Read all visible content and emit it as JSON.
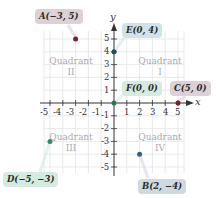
{
  "diagram": {
    "axes": {
      "x_label": "x",
      "y_label": "y",
      "x_range": [
        -5,
        5
      ],
      "y_range": [
        -5,
        5
      ]
    },
    "x_ticks": [
      "-5",
      "-4",
      "-3",
      "-2",
      "-1",
      "1",
      "2",
      "3",
      "4",
      "5"
    ],
    "y_ticks": [
      "5",
      "4",
      "3",
      "2",
      "1",
      "-1",
      "-2",
      "-3",
      "-4",
      "-5"
    ],
    "quadrants": [
      {
        "name": "Quadrant",
        "numeral": "I"
      },
      {
        "name": "Quadrant",
        "numeral": "II"
      },
      {
        "name": "Quadrant",
        "numeral": "III"
      },
      {
        "name": "Quadrant",
        "numeral": "IV"
      }
    ],
    "points": [
      {
        "label": "A(−3, 5)",
        "x": -3,
        "y": 5,
        "color": "#7a1f2e",
        "box_color": "#ddd0d6"
      },
      {
        "label": "B(2, −4)",
        "x": 2,
        "y": -4,
        "color": "#3b5f86",
        "box_color": "#cfd9e2"
      },
      {
        "label": "C(5, 0)",
        "x": 5,
        "y": 0,
        "color": "#7a1f2e",
        "box_color": "#ddd0d6"
      },
      {
        "label": "D(−5, −3)",
        "x": -5,
        "y": -3,
        "color": "#2e8a6a",
        "box_color": "#d3ebe0"
      },
      {
        "label": "E(0, 4)",
        "x": 0,
        "y": 4,
        "color": "#1f4f66",
        "box_color": "#cfe4e8"
      },
      {
        "label": "F(0, 0)",
        "x": 0,
        "y": 0,
        "color": "#1f7a52",
        "box_color": "#d3ebe0"
      }
    ]
  }
}
